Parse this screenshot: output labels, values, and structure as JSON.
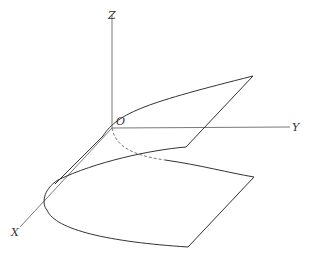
{
  "diagram": {
    "type": "3d-surface-parabolic-cylinder",
    "axes": {
      "x_label": "X",
      "y_label": "Y",
      "z_label": "Z",
      "origin_label": "O"
    },
    "colors": {
      "line": "#333333",
      "axis": "#555555",
      "background": "#ffffff"
    }
  }
}
